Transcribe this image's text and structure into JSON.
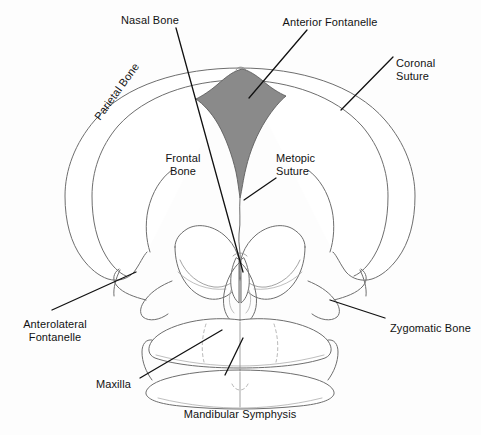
{
  "figure": {
    "type": "anatomical-diagram",
    "background_color": "#fdfdfd",
    "outline_color": "#6e6e6e",
    "leader_line_color": "#111111",
    "fontanelle_fill_color": "#8a8a8a",
    "text_color": "#121212"
  },
  "labels": {
    "nasal_bone": "Nasal Bone",
    "anterior_fontanelle": "Anterior Fontanelle",
    "coronal_suture_line1": "Coronal",
    "coronal_suture_line2": "Suture",
    "parietal_bone": "Parietal Bone",
    "frontal_bone_line1": "Frontal",
    "frontal_bone_line2": "Bone",
    "metopic_suture_line1": "Metopic",
    "metopic_suture_line2": "Suture",
    "anterolateral_fontanelle_line1": "Anterolateral",
    "anterolateral_fontanelle_line2": "Fontanelle",
    "zygomatic_bone": "Zygomatic Bone",
    "maxilla": "Maxilla",
    "mandibular_symphysis": "Mandibular Symphysis"
  },
  "structures": [
    {
      "name": "nasal-bone",
      "label": "Nasal Bone"
    },
    {
      "name": "anterior-fontanelle",
      "label": "Anterior Fontanelle"
    },
    {
      "name": "coronal-suture",
      "label": "Coronal Suture"
    },
    {
      "name": "parietal-bone",
      "label": "Parietal Bone"
    },
    {
      "name": "frontal-bone",
      "label": "Frontal Bone"
    },
    {
      "name": "metopic-suture",
      "label": "Metopic Suture"
    },
    {
      "name": "anterolateral-fontanelle",
      "label": "Anterolateral Fontanelle"
    },
    {
      "name": "zygomatic-bone",
      "label": "Zygomatic Bone"
    },
    {
      "name": "maxilla",
      "label": "Maxilla"
    },
    {
      "name": "mandibular-symphysis",
      "label": "Mandibular Symphysis"
    }
  ]
}
